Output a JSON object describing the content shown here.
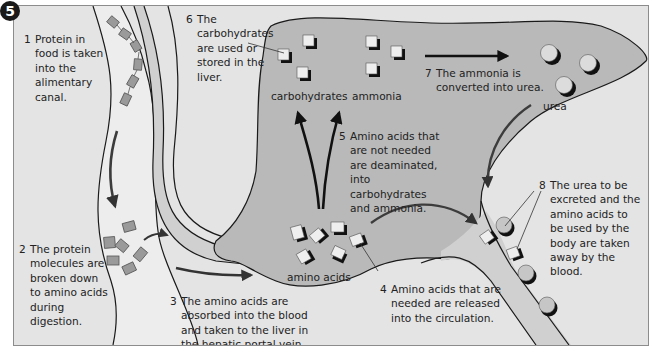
{
  "figure": {
    "step_badge": "5",
    "colors": {
      "background": "#e4e4e4",
      "liver": "#b9b9b9",
      "vessel": "#d0d0d0",
      "outline": "#1a1a1a",
      "protein_block": "#9a9a9a",
      "arrow": "#3c3c3c"
    }
  },
  "labels": [
    {
      "num": "1",
      "text": "Protein in food is taken into the alimentary canal."
    },
    {
      "num": "2",
      "text": "The protein molecules are broken down to amino acids during digestion."
    },
    {
      "num": "3",
      "text": "The amino acids are absorbed into the blood and taken to the liver in the hepatic portal vein."
    },
    {
      "num": "4",
      "text": "Amino acids that are needed are released into the circulation."
    },
    {
      "num": "5",
      "text": "Amino acids that are not needed are deaminated, into carbohydrates and ammonia."
    },
    {
      "num": "6",
      "text": "The carbohydrates are used or stored in the liver."
    },
    {
      "num": "7",
      "text": "The ammonia is converted into urea."
    },
    {
      "num": "8",
      "text": "The urea to be excreted and the amino acids to be used by the body are taken away by the blood."
    }
  ],
  "tags": {
    "carbohydrates": "carbohydrates",
    "ammonia": "ammonia",
    "urea": "urea",
    "amino_acids": "amino acids"
  }
}
